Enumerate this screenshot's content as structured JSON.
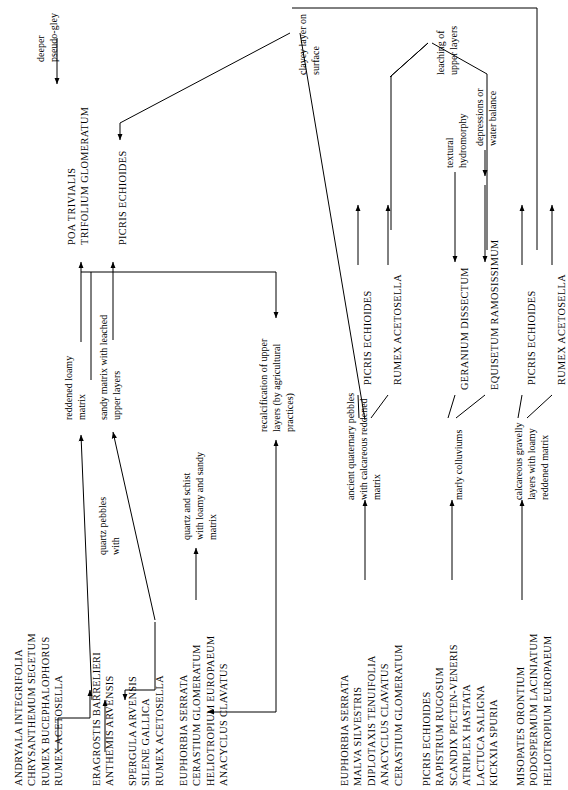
{
  "figure": {
    "type": "flow-diagram",
    "orientation": "text rotated 90 degrees counter-clockwise",
    "title": ""
  },
  "groups": {
    "g1": {
      "name": "andryala-group",
      "species": [
        "ANDRYALA INTEGRIFOLIA",
        "CHRYSANTHEMUM SEGETUM",
        "RUMEX BUCEPHALOPHORUS",
        "RUMEX ACETOSELLA"
      ]
    },
    "g2": {
      "name": "eragrostis-group",
      "species": [
        "ERAGROSTIS BARRELIERI",
        "ANTHEMIS ARVENSIS"
      ]
    },
    "g3": {
      "name": "spergula-group",
      "species": [
        "SPERGULA ARVENSIS",
        "SILENE GALLICA",
        "RUMEX ACETOSELLA"
      ]
    },
    "g4": {
      "name": "euphorbia-group-left",
      "species": [
        "EUPHORBIA SERRATA",
        "CERASTIUM GLOMERATUM",
        "HELIOTROPIUM EUROPAEUM",
        "ANACYCLUS CLAVATUS"
      ]
    },
    "g5": {
      "name": "euphorbia-malva-group",
      "species": [
        "EUPHORBIA SERRATA",
        "MALVA SILVESTRIS",
        "DIPLOTAXIS TENUIFOLIA",
        "ANACYCLUS CLAVATUS",
        "CERASTIUM GLOMERATUM"
      ]
    },
    "g6": {
      "name": "picris-rapistrum-group",
      "species": [
        "PICRIS ECHIOIDES",
        "RAPISTRUM RUGOSUM",
        "SCANDIX PECTEN-VENERIS",
        "ATRIPLEX HASTATA",
        "LACTUCA SALIGNA",
        "KICKXIA SPURIA"
      ]
    },
    "g7": {
      "name": "misopates-group",
      "species": [
        "MISOPATES ORONTIUM",
        "PODOSPERMUM LACINIATUM",
        "HELIOTROPIUM EUROPAEUM"
      ]
    },
    "g8": {
      "name": "poa-trifolium-group",
      "species": [
        "POA TRIVIALIS",
        "TRIFOLIUM GLOMERATUM"
      ]
    }
  },
  "singles": {
    "picris_echioides_top": "PICRIS ECHIOIDES",
    "picris_echioides_mid": "PICRIS ECHIOIDES",
    "rumex_acetosella_mid": "RUMEX ACETOSELLA",
    "geranium_dissectum": "GERANIUM DISSECTUM",
    "equisetum_ramosissimum": "EQUISETUM RAMOSISSIMUM",
    "picris_echioides_right": "PICRIS ECHIOIDES",
    "rumex_acetosella_right": "RUMEX ACETOSELLA"
  },
  "descriptors": {
    "deeper_pseudo_gley": [
      "deeper",
      "pseudo-gley"
    ],
    "reddened_loamy_matrix": [
      "reddened loamy",
      "matrix"
    ],
    "sandy_matrix_leached": [
      "sandy matrix with leached",
      "upper layers"
    ],
    "quartz_pebbles_with": [
      "quartz pebbles",
      "with"
    ],
    "quartz_schist_loamy_sandy": [
      "quartz and schist",
      "with loamy and sandy",
      "matrix"
    ],
    "recalcification": [
      "recalcification of upper",
      "layers (by agricultural",
      "practices)"
    ],
    "clayey_layer_on_surface": [
      "clayey layer on",
      "surface"
    ],
    "leaching_of_upper_layers": [
      "leaching of",
      "upper layers"
    ],
    "textural_hydromorphy": [
      "textural",
      "hydromorphy"
    ],
    "depressions_or_water_balance": [
      "depressions or",
      "water balance"
    ],
    "ancient_quaternary_pebbles": [
      "ancient quaternary pebbles",
      "with calcareous reddened",
      "matrix"
    ],
    "marly_colluviums": [
      "marly colluviums"
    ],
    "calcareous_gravelly": [
      "calcareous gravelly",
      "layers with loamy",
      "reddened matrix"
    ]
  },
  "style": {
    "stroke": "#000000",
    "background": "#ffffff"
  }
}
